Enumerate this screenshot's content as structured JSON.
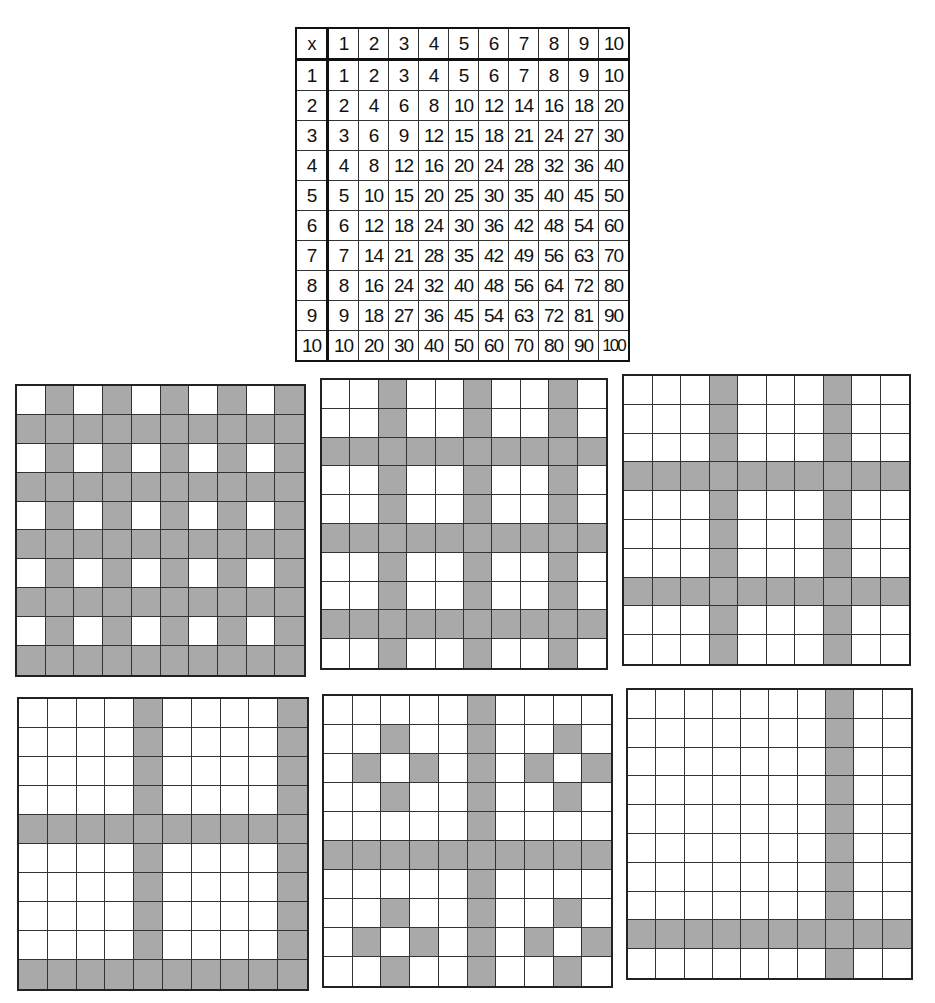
{
  "multiplication_table": {
    "corner_label": "x",
    "column_headers": [
      "1",
      "2",
      "3",
      "4",
      "5",
      "6",
      "7",
      "8",
      "9",
      "10"
    ],
    "rows": [
      {
        "header": "1",
        "values": [
          "1",
          "2",
          "3",
          "4",
          "5",
          "6",
          "7",
          "8",
          "9",
          "10"
        ]
      },
      {
        "header": "2",
        "values": [
          "2",
          "4",
          "6",
          "8",
          "10",
          "12",
          "14",
          "16",
          "18",
          "20"
        ]
      },
      {
        "header": "3",
        "values": [
          "3",
          "6",
          "9",
          "12",
          "15",
          "18",
          "21",
          "24",
          "27",
          "30"
        ]
      },
      {
        "header": "4",
        "values": [
          "4",
          "8",
          "12",
          "16",
          "20",
          "24",
          "28",
          "32",
          "36",
          "40"
        ]
      },
      {
        "header": "5",
        "values": [
          "5",
          "10",
          "15",
          "20",
          "25",
          "30",
          "35",
          "40",
          "45",
          "50"
        ]
      },
      {
        "header": "6",
        "values": [
          "6",
          "12",
          "18",
          "24",
          "30",
          "36",
          "42",
          "48",
          "54",
          "60"
        ]
      },
      {
        "header": "7",
        "values": [
          "7",
          "14",
          "21",
          "28",
          "35",
          "42",
          "49",
          "56",
          "63",
          "70"
        ]
      },
      {
        "header": "8",
        "values": [
          "8",
          "16",
          "24",
          "32",
          "40",
          "48",
          "56",
          "64",
          "72",
          "80"
        ]
      },
      {
        "header": "9",
        "values": [
          "9",
          "18",
          "27",
          "36",
          "45",
          "54",
          "63",
          "72",
          "81",
          "90"
        ]
      },
      {
        "header": "10",
        "values": [
          "10",
          "20",
          "30",
          "40",
          "50",
          "60",
          "70",
          "80",
          "90",
          "100"
        ]
      }
    ]
  },
  "colors": {
    "shade": "#a9a9a9",
    "line": "#333333",
    "background": "#ffffff"
  },
  "grids": [
    {
      "id": "grid-1",
      "box": {
        "left": 15,
        "top": 384,
        "width": 291,
        "height": 293
      },
      "shaded_rows": [
        2,
        4,
        6,
        8,
        10
      ],
      "shaded_cols": [
        2,
        4,
        6,
        8,
        10
      ],
      "extra_cells": []
    },
    {
      "id": "grid-2",
      "box": {
        "left": 320,
        "top": 378,
        "width": 288,
        "height": 292
      },
      "shaded_rows": [
        3,
        6,
        9
      ],
      "shaded_cols": [
        3,
        6,
        9
      ],
      "extra_cells": []
    },
    {
      "id": "grid-3",
      "box": {
        "left": 622,
        "top": 374,
        "width": 289,
        "height": 292
      },
      "shaded_rows": [
        4,
        8
      ],
      "shaded_cols": [
        4,
        8
      ],
      "extra_cells": []
    },
    {
      "id": "grid-4",
      "box": {
        "left": 17,
        "top": 697,
        "width": 292,
        "height": 294
      },
      "shaded_rows": [
        5,
        10
      ],
      "shaded_cols": [
        5,
        10
      ],
      "extra_cells": []
    },
    {
      "id": "grid-5",
      "box": {
        "left": 322,
        "top": 694,
        "width": 291,
        "height": 294
      },
      "shaded_rows": [
        6
      ],
      "shaded_cols": [
        6
      ],
      "extra_cells": [
        [
          2,
          3
        ],
        [
          2,
          9
        ],
        [
          3,
          2
        ],
        [
          3,
          4
        ],
        [
          3,
          8
        ],
        [
          3,
          10
        ],
        [
          4,
          3
        ],
        [
          4,
          9
        ],
        [
          8,
          3
        ],
        [
          8,
          9
        ],
        [
          9,
          2
        ],
        [
          9,
          4
        ],
        [
          9,
          8
        ],
        [
          9,
          10
        ],
        [
          10,
          3
        ],
        [
          10,
          9
        ]
      ]
    },
    {
      "id": "grid-6",
      "box": {
        "left": 626,
        "top": 688,
        "width": 287,
        "height": 292
      },
      "shaded_rows": [
        9
      ],
      "shaded_cols": [
        8
      ],
      "extra_cells": []
    }
  ]
}
